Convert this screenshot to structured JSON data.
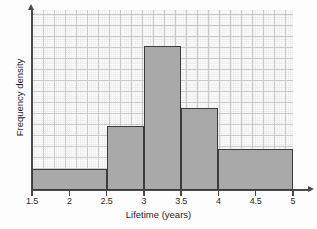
{
  "chart_data": {
    "type": "bar",
    "title": "",
    "subtitle": "",
    "xlabel": "Lifetime (years)",
    "ylabel": "Frequency density",
    "xlim": [
      1.5,
      5.0
    ],
    "ylim": [
      0,
      7
    ],
    "grid": true,
    "legend": null,
    "x_ticks": [
      "1.5",
      "2",
      "2.5",
      "3",
      "3.5",
      "4",
      "4.5",
      "5"
    ],
    "x_tick_values": [
      1.5,
      2,
      2.5,
      3,
      3.5,
      4,
      4.5,
      5
    ],
    "y_ticks": [],
    "bin_edges": [
      1.5,
      2.5,
      3.0,
      3.5,
      4.0,
      5.0
    ],
    "bars": [
      {
        "label": "1.5-2.5",
        "x0": 1.5,
        "x1": 2.5,
        "value": 0.8
      },
      {
        "label": "2.5-3",
        "x0": 2.5,
        "x1": 3.0,
        "value": 2.5
      },
      {
        "label": "3-3.5",
        "x0": 3.0,
        "x1": 3.5,
        "value": 5.6
      },
      {
        "label": "3.5-4",
        "x0": 3.5,
        "x1": 4.0,
        "value": 3.2
      },
      {
        "label": "4-5",
        "x0": 4.0,
        "x1": 5.0,
        "value": 1.6
      }
    ],
    "categories": [
      "1.5-2.5",
      "2.5-3",
      "3-3.5",
      "3.5-4",
      "4-5"
    ],
    "values": [
      0.8,
      2.5,
      5.6,
      3.2,
      1.6
    ],
    "colors": {
      "bar_fill": "#a9a9a9",
      "bar_stroke": "#3c3c3c",
      "axis": "#4a4a4a",
      "grid_major": "#c9c9c9",
      "grid_minor": "#ececec",
      "background": "#ffffff",
      "text": "#1e1e1e"
    }
  }
}
